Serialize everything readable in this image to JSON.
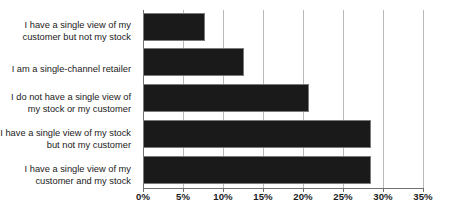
{
  "chart_data": {
    "type": "bar",
    "orientation": "horizontal",
    "title": "",
    "subtitle": "",
    "xlabel": "",
    "ylabel": "",
    "categories": [
      "I have a single view of my\ncustomer but not my stock",
      "I am a single-channel retailer",
      "I do not have a single view of\nmy stock or my customer",
      "I have a single view of my\nstock but not my customer",
      "I have a single view of my\ncustomer and my stock"
    ],
    "values": [
      7.8,
      12.6,
      20.8,
      28.5,
      28.5
    ],
    "value_unit": "%",
    "xlim": [
      0,
      35
    ],
    "xticks": [
      0,
      5,
      10,
      15,
      20,
      25,
      30,
      35
    ],
    "xtick_labels": [
      "0%",
      "5%",
      "10%",
      "15%",
      "20%",
      "25%",
      "30%",
      "35%"
    ],
    "grid": "vertical",
    "legend": "none",
    "series": [
      {
        "name": "Share of respondents",
        "values": [
          7.8,
          12.6,
          20.8,
          28.5,
          28.5
        ],
        "color": "#1a1a1a"
      }
    ]
  },
  "colors": {
    "bar": "#1a1a1a",
    "bar_border": "#7a7a7a",
    "gridline": "#b9b9b9",
    "axis": "#6f6f6f",
    "text": "#1b1b1b",
    "background": "#ffffff"
  }
}
